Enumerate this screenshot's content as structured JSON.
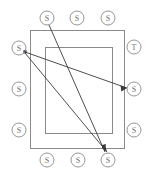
{
  "diagram": {
    "background_color": "#ffffff",
    "shape_stroke_color": "#8a8a8a",
    "edge_stroke_color": "#3a3a3a",
    "label_color": "#6f6f6f",
    "rectangles": [
      {
        "name": "outer-rectangle",
        "x": 30,
        "y": 30,
        "width": 94,
        "height": 118
      },
      {
        "name": "inner-rectangle",
        "x": 45,
        "y": 47,
        "width": 67,
        "height": 86
      }
    ],
    "nodes": [
      {
        "id": "n-top-1",
        "label": "S",
        "cx": 47,
        "cy": 18,
        "r": 7,
        "side": "top"
      },
      {
        "id": "n-top-2",
        "label": "S",
        "cx": 77,
        "cy": 18,
        "r": 7,
        "side": "top"
      },
      {
        "id": "n-top-3",
        "label": "S",
        "cx": 108,
        "cy": 18,
        "r": 7,
        "side": "top"
      },
      {
        "id": "n-left-1",
        "label": "S",
        "cx": 19,
        "cy": 48,
        "r": 7,
        "side": "left"
      },
      {
        "id": "n-left-2",
        "label": "S",
        "cx": 19,
        "cy": 89,
        "r": 7,
        "side": "left"
      },
      {
        "id": "n-left-3",
        "label": "S",
        "cx": 19,
        "cy": 130,
        "r": 7,
        "side": "left"
      },
      {
        "id": "n-right-1",
        "label": "T",
        "cx": 134,
        "cy": 47,
        "r": 7,
        "side": "right"
      },
      {
        "id": "n-right-2",
        "label": "S",
        "cx": 134,
        "cy": 89,
        "r": 7,
        "side": "right"
      },
      {
        "id": "n-right-3",
        "label": "S",
        "cx": 134,
        "cy": 130,
        "r": 7,
        "side": "right"
      },
      {
        "id": "n-bottom-1",
        "label": "S",
        "cx": 47,
        "cy": 160,
        "r": 7,
        "side": "bottom"
      },
      {
        "id": "n-bottom-2",
        "label": "S",
        "cx": 78,
        "cy": 160,
        "r": 7,
        "side": "bottom"
      },
      {
        "id": "n-bottom-3",
        "label": "S",
        "cx": 108,
        "cy": 160,
        "r": 7,
        "side": "bottom"
      }
    ],
    "edges": [
      {
        "id": "e1",
        "from": "n-left-1",
        "to": "n-right-2",
        "x1": 25,
        "y1": 52,
        "x2": 127,
        "y2": 88,
        "directed": true
      },
      {
        "id": "e2",
        "from": "n-left-1",
        "to": "n-bottom-3",
        "x1": 25,
        "y1": 53,
        "x2": 107,
        "y2": 152,
        "directed": true
      },
      {
        "id": "e3",
        "from": "n-top-1",
        "to": "n-bottom-3",
        "x1": 49,
        "y1": 25,
        "x2": 105,
        "y2": 152,
        "directed": true
      }
    ],
    "edge_count": 3,
    "node_count": 12,
    "labels_used": [
      "S",
      "T"
    ]
  }
}
